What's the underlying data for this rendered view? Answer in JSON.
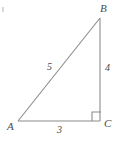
{
  "figure": {
    "type": "right-triangle-diagram",
    "stroke_color": "#8c8c8c",
    "label_color": "#4a4a4a",
    "background_color": "#ffffff",
    "vertices": [
      {
        "name": "A",
        "label": "A",
        "x": 18,
        "y": 121,
        "position": "bottom-left"
      },
      {
        "name": "B",
        "label": "B",
        "x": 100,
        "y": 18,
        "position": "top-right"
      },
      {
        "name": "C",
        "label": "C",
        "x": 100,
        "y": 121,
        "position": "bottom-right"
      }
    ],
    "sides": [
      {
        "name": "hypotenuse",
        "from": "A",
        "to": "B",
        "label": "5"
      },
      {
        "name": "vertical-leg",
        "from": "B",
        "to": "C",
        "label": "4"
      },
      {
        "name": "base-leg",
        "from": "A",
        "to": "C",
        "label": "3"
      }
    ],
    "right_angle": {
      "at_vertex": "C",
      "marker": "square",
      "size": 9
    }
  }
}
